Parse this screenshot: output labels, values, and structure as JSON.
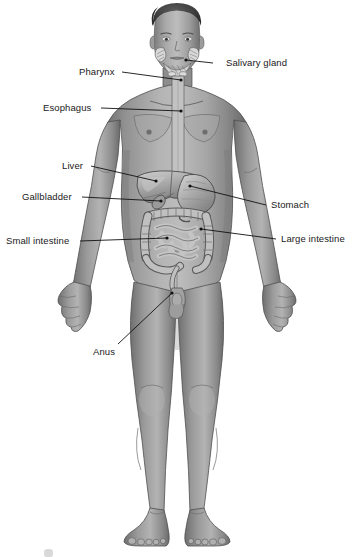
{
  "figure": {
    "style": "grayscale medical illustration on white background",
    "background_color": "#ffffff",
    "skin_tone": "#8d8d8d",
    "organ_tone": "#a8a8a8",
    "line_color": "#111111"
  },
  "labels": [
    {
      "id": "salivary-gland",
      "text": "Salivary gland",
      "side": "right",
      "text_x": 226,
      "text_y": 58,
      "leader": {
        "x1": 213,
        "y1": 63,
        "x2": 186,
        "y2": 60
      },
      "dot": {
        "x": 186,
        "y": 60
      }
    },
    {
      "id": "pharynx",
      "text": "Pharynx",
      "side": "left",
      "text_x": 79,
      "text_y": 67,
      "leader": {
        "x1": 122,
        "y1": 72,
        "x2": 181,
        "y2": 80
      },
      "dot": {
        "x": 181,
        "y": 80
      }
    },
    {
      "id": "esophagus",
      "text": "Esophagus",
      "side": "left",
      "text_x": 43,
      "text_y": 103,
      "leader": {
        "x1": 101,
        "y1": 108,
        "x2": 181,
        "y2": 111
      },
      "dot": {
        "x": 181,
        "y": 111
      }
    },
    {
      "id": "liver",
      "text": "Liver",
      "side": "left",
      "text_x": 62,
      "text_y": 161,
      "leader": {
        "x1": 91,
        "y1": 166,
        "x2": 156,
        "y2": 181
      },
      "dot": {
        "x": 156,
        "y": 181
      }
    },
    {
      "id": "gallbladder",
      "text": "Gallbladder",
      "side": "left",
      "text_x": 22,
      "text_y": 192,
      "leader": {
        "x1": 82,
        "y1": 197,
        "x2": 161,
        "y2": 201
      },
      "dot": {
        "x": 161,
        "y": 201
      }
    },
    {
      "id": "stomach",
      "text": "Stomach",
      "side": "right",
      "text_x": 271,
      "text_y": 200,
      "leader": {
        "x1": 266,
        "y1": 205,
        "x2": 190,
        "y2": 186
      },
      "dot": {
        "x": 190,
        "y": 186
      }
    },
    {
      "id": "small-intestine",
      "text": "Small intestine",
      "side": "left",
      "text_x": 6,
      "text_y": 236,
      "leader": {
        "x1": 80,
        "y1": 241,
        "x2": 167,
        "y2": 238
      },
      "dot": {
        "x": 167,
        "y": 238
      }
    },
    {
      "id": "large-intestine",
      "text": "Large intestine",
      "side": "right",
      "text_x": 281,
      "text_y": 234,
      "leader": {
        "x1": 276,
        "y1": 239,
        "x2": 201,
        "y2": 229
      },
      "dot": {
        "x": 201,
        "y": 229
      }
    },
    {
      "id": "anus",
      "text": "Anus",
      "side": "left",
      "text_x": 93,
      "text_y": 347,
      "leader": {
        "x1": 118,
        "y1": 344,
        "x2": 172,
        "y2": 293
      },
      "dot": {
        "x": 172,
        "y": 293
      }
    }
  ],
  "organs_depicted": [
    "salivary glands",
    "pharynx",
    "esophagus",
    "liver",
    "gallbladder",
    "stomach",
    "small intestine",
    "large intestine",
    "rectum",
    "anus"
  ]
}
